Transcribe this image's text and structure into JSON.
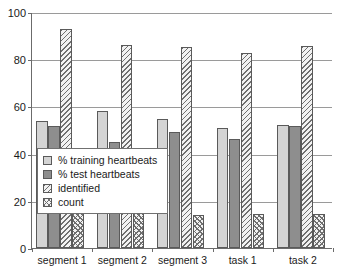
{
  "chart_data": {
    "type": "bar",
    "title": "",
    "xlabel": "",
    "ylabel": "",
    "ylim": [
      0,
      100
    ],
    "yticks": [
      0,
      20,
      40,
      60,
      80,
      100
    ],
    "grid": true,
    "legend_position": "inside-lower-left",
    "categories": [
      "segment 1",
      "segment 2",
      "segment 3",
      "task 1",
      "task 2"
    ],
    "series": [
      {
        "name": "% training heartbeats",
        "pattern": "solid-light",
        "color": "#d4d4d4",
        "values": [
          54,
          58,
          54.5,
          51,
          52
        ]
      },
      {
        "name": "% test heartbeats",
        "pattern": "solid-dark",
        "color": "#8e8e8e",
        "values": [
          51.5,
          45,
          49,
          46,
          51.5
        ]
      },
      {
        "name": "identified",
        "pattern": "diagonal-hatch",
        "color": "#f2f2f2",
        "values": [
          93,
          86,
          85,
          82.5,
          85.5
        ]
      },
      {
        "name": "count",
        "pattern": "chevron-hatch",
        "color": "#f2f2f2",
        "values": [
          15,
          15,
          14,
          14.5,
          14.5
        ]
      }
    ]
  },
  "axis": {
    "y_tick_labels": [
      "0",
      "20",
      "40",
      "60",
      "80",
      "100"
    ],
    "x_tick_labels": [
      "segment 1",
      "segment 2",
      "segment 3",
      "task 1",
      "task 2"
    ]
  },
  "legend": {
    "items": [
      {
        "label": "% training heartbeats"
      },
      {
        "label": "% test heartbeats"
      },
      {
        "label": "identified"
      },
      {
        "label": "count"
      }
    ]
  },
  "colors": {
    "axis": "#6b6b6b",
    "grid": "#9a9a9a",
    "bar_border": "#5a5a5a",
    "text": "#1a1a1a",
    "background": "#ffffff"
  }
}
